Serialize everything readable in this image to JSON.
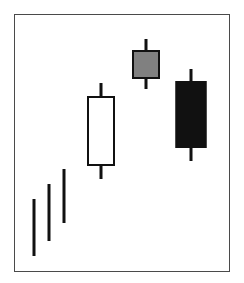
{
  "figure": {
    "title": "",
    "background_color": "#ffffff",
    "frame": {
      "border_color": "#4a4a4a",
      "left": 14,
      "top": 14,
      "width": 216,
      "height": 258
    }
  },
  "colors": {
    "up_body": "#ffffff",
    "neutral_body": "#808080",
    "down_body": "#111111",
    "outline": "#111111",
    "frame": "#4a4a4a"
  },
  "chart_data": {
    "type": "candlestick",
    "title": "",
    "xlabel": "",
    "ylabel": "",
    "grid": false,
    "legend": false,
    "axis_visible": false,
    "xlim": [
      0,
      216
    ],
    "ylim": [
      0,
      258
    ],
    "note": "Rising three / ascending staircase candlestick pattern: three small narrow candles rising, a tall white bullish candle, a small gray candle at the high, then a tall black bearish candle.",
    "candles": [
      {
        "index": 1,
        "label": "candle-1",
        "body_type": "thin",
        "fill": "#111111",
        "center_x": 19,
        "body_top": 184,
        "body_bottom": 241,
        "body_width": 3,
        "wick_top": 184,
        "wick_bottom": 241,
        "wick_width": 2
      },
      {
        "index": 2,
        "label": "candle-2",
        "body_type": "thin",
        "fill": "#111111",
        "center_x": 34,
        "body_top": 169,
        "body_bottom": 226,
        "body_width": 3,
        "wick_top": 169,
        "wick_bottom": 226,
        "wick_width": 2
      },
      {
        "index": 3,
        "label": "candle-3",
        "body_type": "thin",
        "fill": "#111111",
        "center_x": 49,
        "body_top": 154,
        "body_bottom": 208,
        "body_width": 3,
        "wick_top": 154,
        "wick_bottom": 208,
        "wick_width": 2
      },
      {
        "index": 4,
        "label": "candle-4",
        "body_type": "hollow",
        "fill": "#ffffff",
        "center_x": 86,
        "body_top": 81,
        "body_bottom": 151,
        "body_width": 28,
        "wick_top": 68,
        "wick_bottom": 164,
        "wick_width": 3
      },
      {
        "index": 5,
        "label": "candle-5",
        "body_type": "filled-gray",
        "fill": "#808080",
        "center_x": 131,
        "body_top": 35,
        "body_bottom": 64,
        "body_width": 28,
        "wick_top": 24,
        "wick_bottom": 74,
        "wick_width": 3
      },
      {
        "index": 6,
        "label": "candle-6",
        "body_type": "filled-black",
        "fill": "#111111",
        "center_x": 176,
        "body_top": 66,
        "body_bottom": 133,
        "body_width": 31,
        "wick_top": 54,
        "wick_bottom": 146,
        "wick_width": 3
      }
    ]
  }
}
